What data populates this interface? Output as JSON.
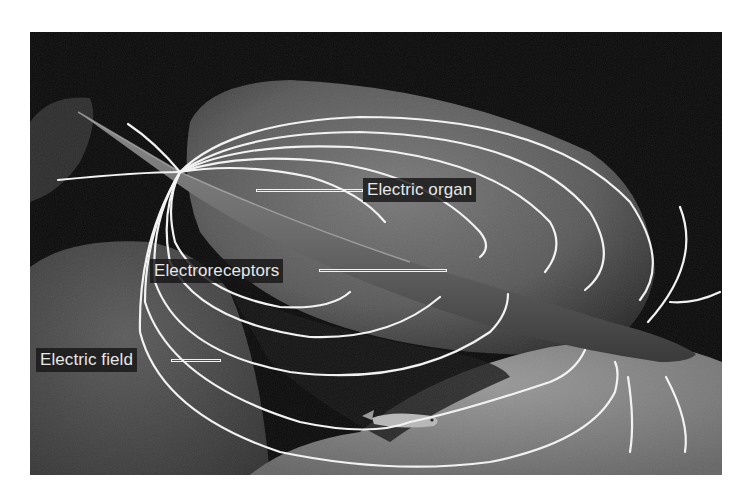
{
  "figure": {
    "background_color": "#0a0a0a",
    "field_line_color": "#f2f2f2",
    "label_bg_color": "#161616",
    "label_text_color": "#e8e8e8"
  },
  "labels": {
    "electric_organ": "Electric organ",
    "electroreceptors": "Electroreceptors",
    "electric_field": "Electric field"
  }
}
